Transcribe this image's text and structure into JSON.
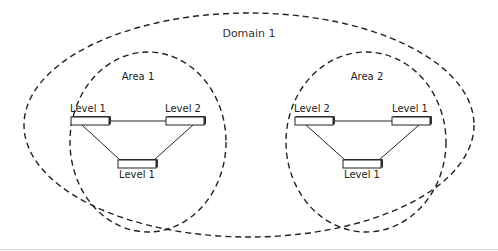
{
  "diagram": {
    "domain": {
      "label": "Domain 1",
      "cx": 249,
      "cy": 125,
      "rx": 225,
      "ry": 112
    },
    "areas": [
      {
        "label": "Area 1",
        "ellipse": {
          "cx": 148,
          "cy": 142,
          "rx": 78,
          "ry": 90
        },
        "label_pos": {
          "x": 138,
          "y": 80
        },
        "routers": [
          {
            "label": "Level 1",
            "x": 71,
            "y": 117,
            "w": 38,
            "h": 8,
            "label_x": 88,
            "label_y": 112
          },
          {
            "label": "Level 2",
            "x": 166,
            "y": 117,
            "w": 38,
            "h": 8,
            "label_x": 183,
            "label_y": 112
          },
          {
            "label": "Level 1",
            "x": 118,
            "y": 160,
            "w": 38,
            "h": 8,
            "label_x": 137,
            "label_y": 178
          }
        ],
        "links": [
          [
            0,
            1
          ],
          [
            0,
            2
          ],
          [
            1,
            2
          ]
        ]
      },
      {
        "label": "Area 2",
        "ellipse": {
          "cx": 366,
          "cy": 142,
          "rx": 80,
          "ry": 90
        },
        "label_pos": {
          "x": 367,
          "y": 80
        },
        "routers": [
          {
            "label": "Level 2",
            "x": 295,
            "y": 117,
            "w": 38,
            "h": 8,
            "label_x": 312,
            "label_y": 112
          },
          {
            "label": "Level 1",
            "x": 392,
            "y": 117,
            "w": 38,
            "h": 8,
            "label_x": 410,
            "label_y": 112
          },
          {
            "label": "Level 1",
            "x": 343,
            "y": 160,
            "w": 38,
            "h": 8,
            "label_x": 362,
            "label_y": 178
          }
        ],
        "links": [
          [
            0,
            1
          ],
          [
            0,
            2
          ],
          [
            1,
            2
          ]
        ]
      }
    ],
    "colors": {
      "stroke": "#222222",
      "box_fill": "#ffffff",
      "box_shadow": "#333333"
    }
  }
}
